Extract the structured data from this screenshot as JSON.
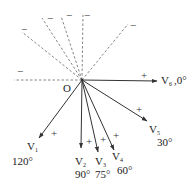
{
  "diagram": {
    "title": "",
    "origin": {
      "label": "O",
      "x": 82,
      "y": 80
    },
    "colors": {
      "solid_line": "#333333",
      "dashed_line": "#666666",
      "text": "#222222",
      "background": "#ffffff"
    },
    "vectors": [
      {
        "id": "V1",
        "main": "V",
        "sub": "1",
        "angle_label": "120°",
        "angle": 120,
        "end": [
          39,
          138
        ],
        "plus": [
          51,
          137
        ],
        "name_pos": [
          27,
          150
        ],
        "angle_pos": [
          12,
          165
        ]
      },
      {
        "id": "V2",
        "main": "V",
        "sub": "2",
        "angle_label": "90°",
        "angle": 90,
        "end": [
          81,
          148
        ],
        "plus": [
          86,
          145
        ],
        "name_pos": [
          75,
          165
        ],
        "angle_pos": [
          75,
          178
        ]
      },
      {
        "id": "V3",
        "main": "V",
        "sub": "3",
        "angle_label": "75°",
        "angle": 75,
        "end": [
          98,
          152
        ],
        "plus": [
          100,
          143
        ],
        "name_pos": [
          95,
          165
        ],
        "angle_pos": [
          95,
          178
        ]
      },
      {
        "id": "V4",
        "main": "V",
        "sub": "4",
        "angle_label": "60°",
        "angle": 60,
        "end": [
          114,
          150
        ],
        "plus": [
          113,
          139
        ],
        "name_pos": [
          112,
          160
        ],
        "angle_pos": [
          117,
          174
        ]
      },
      {
        "id": "V5",
        "main": "V",
        "sub": "5",
        "angle_label": "30°",
        "angle": 30,
        "end": [
          147,
          121
        ],
        "plus": [
          136,
          113
        ],
        "name_pos": [
          149,
          133
        ],
        "angle_pos": [
          157,
          146
        ]
      },
      {
        "id": "V6",
        "main": "V",
        "sub": "6",
        "angle_label": ",0°",
        "angle": 0,
        "end": [
          157,
          81
        ],
        "plus": [
          141,
          79
        ],
        "name_pos": [
          161,
          84
        ],
        "angle_pos": [
          174,
          84
        ]
      }
    ],
    "dashed_extensions": [
      {
        "id": "opp-V6",
        "end": [
          14,
          80
        ],
        "minus": "−",
        "minus_pos": [
          17,
          75
        ]
      },
      {
        "id": "opp-V5",
        "end": [
          22,
          32
        ],
        "minus": "−",
        "minus_pos": [
          21,
          33
        ]
      },
      {
        "id": "opp-V4",
        "end": [
          42,
          18
        ],
        "minus": "−",
        "minus_pos": [
          47,
          22
        ]
      },
      {
        "id": "opp-V3",
        "end": [
          61,
          16
        ],
        "minus": "−",
        "minus_pos": [
          66,
          19
        ]
      },
      {
        "id": "opp-V2",
        "end": [
          83,
          15
        ],
        "minus": "−",
        "minus_pos": [
          84,
          19
        ]
      },
      {
        "id": "opp-V1",
        "end": [
          128,
          24
        ],
        "minus": "−",
        "minus_pos": [
          130,
          29
        ]
      }
    ],
    "labels": {
      "origin": "O",
      "plus": "+",
      "minus": "−"
    }
  }
}
